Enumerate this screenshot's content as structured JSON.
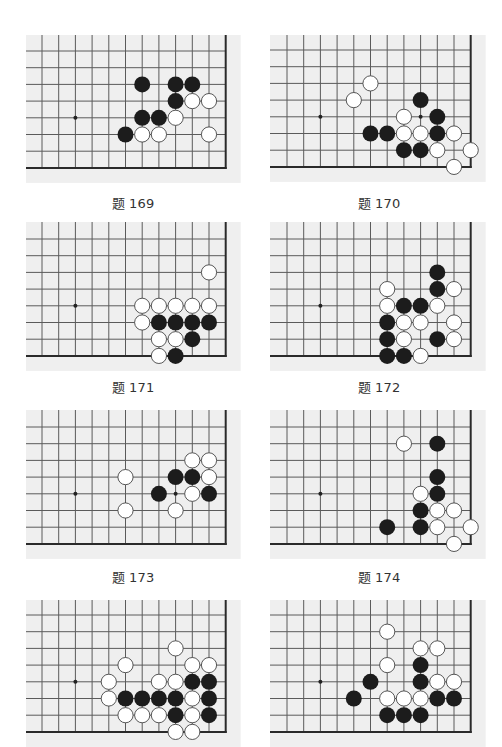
{
  "layout": {
    "grid": {
      "cols": 12,
      "rows": 8,
      "spacing": 16.7,
      "edge_col": 11,
      "edge_row": 7,
      "hoshi": [
        2,
        4
      ]
    },
    "colors": {
      "board_bg": "#efefef",
      "line": "#5a5a5a",
      "edge": "#2a2a2a",
      "black": "#1c1c1c",
      "white": "#ffffff",
      "white_stroke": "#444444"
    }
  },
  "problems": [
    {
      "label": "题 169",
      "black": [
        [
          6,
          2
        ],
        [
          8,
          2
        ],
        [
          9,
          2
        ],
        [
          8,
          3
        ],
        [
          6,
          4
        ],
        [
          7,
          4
        ],
        [
          5,
          5
        ]
      ],
      "white": [
        [
          9,
          3
        ],
        [
          10,
          3
        ],
        [
          8,
          4
        ],
        [
          6,
          5
        ],
        [
          7,
          5
        ],
        [
          10,
          5
        ]
      ],
      "marks": []
    },
    {
      "label": "题 170",
      "black": [
        [
          8,
          3
        ],
        [
          9,
          4
        ],
        [
          5,
          5
        ],
        [
          6,
          5
        ],
        [
          9,
          5
        ],
        [
          7,
          6
        ],
        [
          8,
          6
        ]
      ],
      "white": [
        [
          5,
          2
        ],
        [
          4,
          3
        ],
        [
          7,
          4
        ],
        [
          7,
          5
        ],
        [
          8,
          5
        ],
        [
          10,
          5
        ],
        [
          9,
          6
        ],
        [
          11,
          6
        ],
        [
          10,
          7
        ]
      ],
      "marks": [
        [
          8,
          4
        ]
      ]
    },
    {
      "label": "题 171",
      "black": [
        [
          7,
          5
        ],
        [
          8,
          5
        ],
        [
          9,
          5
        ],
        [
          10,
          5
        ],
        [
          9,
          6
        ],
        [
          8,
          7
        ]
      ],
      "white": [
        [
          10,
          2
        ],
        [
          6,
          4
        ],
        [
          7,
          4
        ],
        [
          8,
          4
        ],
        [
          9,
          4
        ],
        [
          10,
          4
        ],
        [
          6,
          5
        ],
        [
          7,
          6
        ],
        [
          8,
          6
        ],
        [
          7,
          7
        ]
      ],
      "marks": []
    },
    {
      "label": "题 172",
      "black": [
        [
          9,
          2
        ],
        [
          9,
          3
        ],
        [
          7,
          4
        ],
        [
          8,
          4
        ],
        [
          6,
          5
        ],
        [
          6,
          6
        ],
        [
          9,
          6
        ],
        [
          6,
          7
        ],
        [
          7,
          7
        ]
      ],
      "white": [
        [
          6,
          3
        ],
        [
          10,
          3
        ],
        [
          6,
          4
        ],
        [
          9,
          4
        ],
        [
          7,
          5
        ],
        [
          8,
          5
        ],
        [
          10,
          5
        ],
        [
          7,
          6
        ],
        [
          10,
          6
        ],
        [
          8,
          7
        ]
      ],
      "marks": []
    },
    {
      "label": "题 173",
      "black": [
        [
          8,
          3
        ],
        [
          9,
          3
        ],
        [
          7,
          4
        ],
        [
          10,
          4
        ]
      ],
      "white": [
        [
          9,
          2
        ],
        [
          10,
          2
        ],
        [
          5,
          3
        ],
        [
          10,
          3
        ],
        [
          9,
          4
        ],
        [
          5,
          5
        ],
        [
          8,
          5
        ]
      ],
      "marks": [
        [
          8,
          4
        ]
      ]
    },
    {
      "label": "题 174",
      "black": [
        [
          9,
          1
        ],
        [
          9,
          3
        ],
        [
          9,
          4
        ],
        [
          8,
          5
        ],
        [
          6,
          6
        ],
        [
          8,
          6
        ]
      ],
      "white": [
        [
          7,
          1
        ],
        [
          8,
          4
        ],
        [
          9,
          5
        ],
        [
          10,
          5
        ],
        [
          9,
          6
        ],
        [
          11,
          6
        ],
        [
          10,
          7
        ]
      ],
      "marks": []
    },
    {
      "label": "",
      "black": [
        [
          9,
          4
        ],
        [
          10,
          4
        ],
        [
          5,
          5
        ],
        [
          6,
          5
        ],
        [
          7,
          5
        ],
        [
          8,
          5
        ],
        [
          10,
          5
        ],
        [
          8,
          6
        ],
        [
          10,
          6
        ]
      ],
      "white": [
        [
          8,
          2
        ],
        [
          5,
          3
        ],
        [
          9,
          3
        ],
        [
          10,
          3
        ],
        [
          4,
          4
        ],
        [
          7,
          4
        ],
        [
          8,
          4
        ],
        [
          4,
          5
        ],
        [
          9,
          5
        ],
        [
          5,
          6
        ],
        [
          6,
          6
        ],
        [
          7,
          6
        ],
        [
          9,
          6
        ],
        [
          8,
          7
        ],
        [
          9,
          7
        ]
      ],
      "marks": []
    },
    {
      "label": "",
      "black": [
        [
          8,
          3
        ],
        [
          5,
          4
        ],
        [
          8,
          4
        ],
        [
          4,
          5
        ],
        [
          9,
          5
        ],
        [
          10,
          5
        ],
        [
          6,
          6
        ],
        [
          7,
          6
        ],
        [
          8,
          6
        ]
      ],
      "white": [
        [
          6,
          1
        ],
        [
          8,
          2
        ],
        [
          9,
          2
        ],
        [
          6,
          3
        ],
        [
          9,
          4
        ],
        [
          10,
          4
        ],
        [
          6,
          5
        ],
        [
          7,
          5
        ],
        [
          8,
          5
        ]
      ],
      "marks": []
    }
  ]
}
